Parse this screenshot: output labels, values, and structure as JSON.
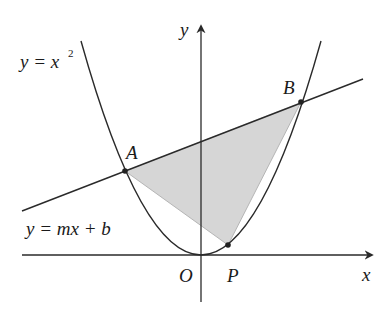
{
  "figure": {
    "labels": {
      "y_axis": "y",
      "x_axis": "x",
      "origin": "O",
      "point_a": "A",
      "point_b": "B",
      "point_p": "P",
      "parabola_eq_lhs": "y = x",
      "parabola_eq_exp": "2",
      "line_eq": "y = mx + b"
    },
    "colors": {
      "stroke": "#2a2a2a",
      "shade_fill": "#d6d6d6",
      "shade_edge": "#b8b8b8",
      "point_fill": "#222222"
    },
    "elements": {
      "curve": "parabola y = x^2",
      "secant_line": "y = mx + b through A and B",
      "shaded_region": "triangle A-B-P",
      "points": [
        "A",
        "B",
        "P",
        "O"
      ]
    }
  }
}
